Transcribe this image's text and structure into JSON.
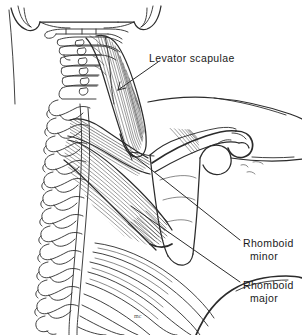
{
  "figure": {
    "background_color": "#ffffff",
    "ink_color": "#2b2b2b",
    "width": 302,
    "height": 335
  },
  "labels": {
    "levator_scapulae": "Levator scapulae",
    "rhomboid_minor_line1": "Rhomboid",
    "rhomboid_minor_line2": "minor",
    "rhomboid_major_line1": "Rhomboid",
    "rhomboid_major_line2": "major",
    "signature": "mc"
  },
  "structures": [
    {
      "name": "skull-base",
      "label": "Occiput / skull base"
    },
    {
      "name": "mastoid-process-left",
      "label": "Mastoid process"
    },
    {
      "name": "mastoid-process-right",
      "label": "Mastoid process"
    },
    {
      "name": "cervical-vertebrae",
      "label": "Cervical vertebrae C1-C7"
    },
    {
      "name": "thoracic-vertebrae",
      "label": "Thoracic vertebrae T1-T12"
    },
    {
      "name": "scapula",
      "label": "Scapula"
    },
    {
      "name": "acromion",
      "label": "Acromion"
    },
    {
      "name": "spine-of-scapula",
      "label": "Spine of scapula"
    },
    {
      "name": "ribs",
      "label": "Ribs"
    },
    {
      "name": "levator-scapulae-muscle",
      "label": "Levator scapulae muscle"
    },
    {
      "name": "rhomboid-minor-muscle",
      "label": "Rhomboid minor muscle"
    },
    {
      "name": "rhomboid-major-muscle",
      "label": "Rhomboid major muscle"
    },
    {
      "name": "shoulder-contour",
      "label": "Shoulder skin contour"
    },
    {
      "name": "arm-contour",
      "label": "Arm skin contour"
    }
  ]
}
